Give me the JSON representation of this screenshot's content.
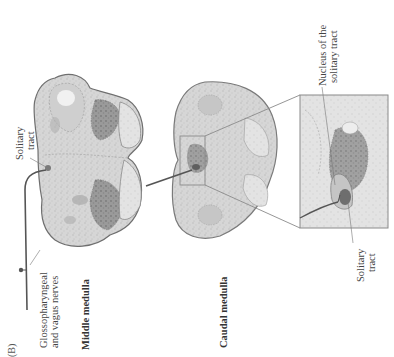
{
  "figure": {
    "panel_label": "(B)",
    "sections": [
      {
        "id": "middle",
        "label": "Middle medulla"
      },
      {
        "id": "caudal",
        "label": "Caudal medulla"
      }
    ],
    "annotations": {
      "solitary_tract_middle": [
        "Solitary",
        "tract"
      ],
      "nerves": [
        "Glossopharyngeal",
        "and vagus nerves"
      ],
      "nucleus": [
        "Nucleus of the",
        "solitary tract"
      ],
      "solitary_tract_inset": [
        "Solitary",
        "tract"
      ]
    },
    "colors": {
      "tissue_light": "#d9d9d9",
      "tissue_mid": "#b5b5b5",
      "tissue_dark": "#8a8a8a",
      "outline": "#777777",
      "nerve_line": "#555555",
      "nucleus_dark": "#6e6e6e"
    }
  }
}
